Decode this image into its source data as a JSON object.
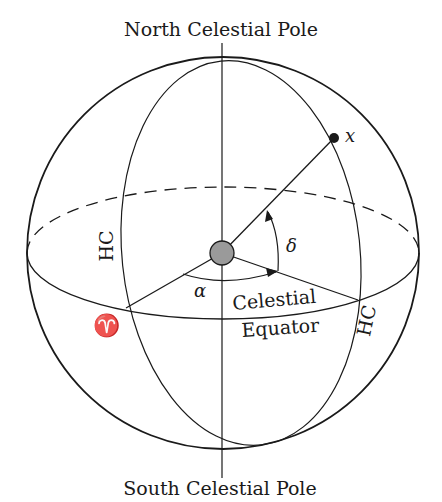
{
  "diagram": {
    "labels": {
      "north_pole": "North Celestial Pole",
      "south_pole": "South Celestial Pole",
      "equator_line1": "Celestial",
      "equator_line2": "Equator",
      "hour_circle_left": "HC",
      "hour_circle_right": "HC",
      "right_ascension": "α",
      "declination": "δ",
      "star": "x",
      "vernal_equinox": "♈"
    },
    "colors": {
      "stroke": "#1a1a1a",
      "earth_fill": "#9a9a9a",
      "background": "#ffffff"
    }
  }
}
